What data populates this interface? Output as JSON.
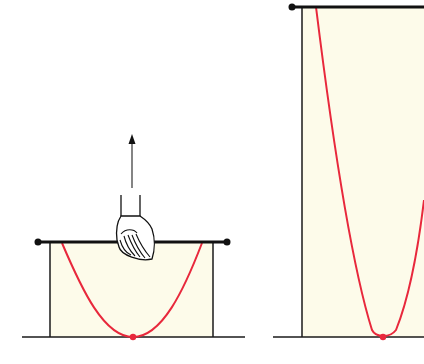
{
  "diagram": {
    "type": "physics-illustration",
    "colors": {
      "background": "#ffffff",
      "film_fill": "#fdfbea",
      "frame_line": "#1a1a1a",
      "curve": "#e8283c",
      "contact_dot": "#e8283c",
      "bar_end_dot": "#111111",
      "hand_fill": "#ffffff",
      "arrow": "#222222"
    },
    "panels": [
      {
        "id": "left",
        "crossbar": {
          "y": 242,
          "x1": 38,
          "x2": 227
        },
        "frame": {
          "left_x": 50,
          "right_x": 213,
          "bottom_y": 337
        },
        "baseline": {
          "x1": 22,
          "x2": 245,
          "y": 337
        },
        "curve": {
          "left_top": [
            62,
            243
          ],
          "bottom": [
            133,
            337
          ],
          "right_top": [
            202,
            243
          ]
        },
        "hand": {
          "present": true,
          "x": 136,
          "y": 230
        },
        "arrow": {
          "present": true,
          "direction": "up",
          "x": 132,
          "y_from": 188,
          "y_to": 135
        }
      },
      {
        "id": "right",
        "crossbar": {
          "y": 7,
          "x1": 292,
          "x2": 424
        },
        "frame": {
          "left_x": 302,
          "bottom_y": 337
        },
        "baseline": {
          "x1": 273,
          "x2": 424,
          "y": 337
        },
        "curve": {
          "left_top": [
            316,
            7
          ],
          "bottom": [
            383,
            337
          ],
          "right_exit": [
            424,
            200
          ]
        },
        "hand": {
          "present": false
        },
        "arrow": {
          "present": false
        }
      }
    ]
  }
}
